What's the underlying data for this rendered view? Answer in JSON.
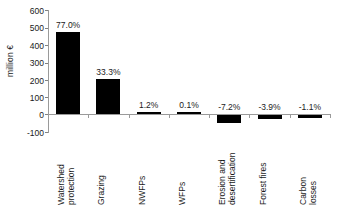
{
  "chart_data": {
    "type": "bar",
    "title": "",
    "subtitle": "",
    "xlabel": "",
    "ylabel": "million €",
    "ylim": [
      -100,
      600
    ],
    "yticks": [
      600,
      500,
      400,
      300,
      200,
      100,
      0,
      -100
    ],
    "ytick_labels": [
      "600",
      "500",
      "400",
      "300",
      "200",
      "100",
      "0",
      "-100"
    ],
    "grid": false,
    "legend": false,
    "bar_color": "#000000",
    "axis_color": "#9a9a9a",
    "categories": [
      "Watershed protection",
      "Grazing",
      "NWFPs",
      "WFPs",
      "Erosion and desertification",
      "Forest fires",
      "Carbon losses"
    ],
    "category_lines": [
      [
        "Watershed",
        "protection"
      ],
      [
        "Grazing"
      ],
      [
        "NWFPs"
      ],
      [
        "WFPs"
      ],
      [
        "Erosion and",
        "desertification"
      ],
      [
        "Forest fires"
      ],
      [
        "Carbon",
        "losses"
      ]
    ],
    "values": [
      475,
      205,
      7,
      1,
      -44,
      -24,
      -7
    ],
    "data_labels": [
      "77.0%",
      "33.3%",
      "1.2%",
      "0.1%",
      "-7.2%",
      "-3.9%",
      "-1.1%"
    ]
  }
}
